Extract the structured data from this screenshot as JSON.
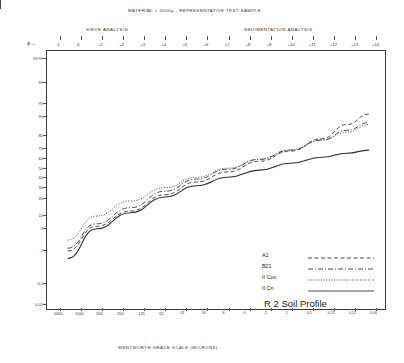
{
  "header": {
    "material_title": "MATERIAL   < 2000µ   -   REPRESENTATIVE  TEST  SAMPLE",
    "sieve_analysis": "SIEVE   ANALYSIS",
    "sedimentation_analysis": "SEDIMENTATION   ANALYSIS",
    "phi_arrow": "φ →"
  },
  "chart_data": {
    "type": "line",
    "title": "R 2 Soil Profile",
    "xlabel": "WENTWORTH GRADE SCALE (MICRONS)",
    "ylabel": "CUMULATIVE WEIGHT PERCENT",
    "xscale": "phi / log-micron",
    "yscale": "probability",
    "grid": false,
    "legend_position": "lower-right",
    "phi_ticks": [
      "-1",
      "0",
      "+1",
      "+2",
      "+3",
      "+4",
      "+5",
      "+6",
      "+7",
      "+8",
      "+9",
      "+10",
      "+11",
      "+12",
      "+13",
      "+14"
    ],
    "x_ticks_microns": [
      "2000",
      "1000",
      "500",
      "250",
      "125",
      "62",
      "31",
      "16",
      "8",
      "4",
      "2",
      "1",
      "0.5",
      "0.25",
      "0.12",
      "0.06"
    ],
    "y_ticks": [
      "0.01",
      "0.1",
      "1",
      "5",
      "10",
      "20",
      "30",
      "40",
      "50",
      "60",
      "70",
      "80",
      "90",
      "95",
      "99",
      "99.99"
    ],
    "series": [
      {
        "name": "A1",
        "style": "dashed",
        "points": [
          {
            "x": 0.04,
            "y": 1.0
          },
          {
            "x": 0.13,
            "y": 6.0
          },
          {
            "x": 0.24,
            "y": 13.0
          },
          {
            "x": 0.35,
            "y": 24.0
          },
          {
            "x": 0.45,
            "y": 36.0
          },
          {
            "x": 0.55,
            "y": 47.0
          },
          {
            "x": 0.65,
            "y": 58.0
          },
          {
            "x": 0.75,
            "y": 68.0
          },
          {
            "x": 0.85,
            "y": 78.0
          },
          {
            "x": 0.93,
            "y": 86.0
          },
          {
            "x": 1.0,
            "y": 91.0
          }
        ]
      },
      {
        "name": "B21",
        "style": "dash-dot",
        "points": [
          {
            "x": 0.04,
            "y": 1.5
          },
          {
            "x": 0.13,
            "y": 7.0
          },
          {
            "x": 0.24,
            "y": 15.0
          },
          {
            "x": 0.35,
            "y": 27.0
          },
          {
            "x": 0.45,
            "y": 39.0
          },
          {
            "x": 0.55,
            "y": 50.0
          },
          {
            "x": 0.65,
            "y": 60.0
          },
          {
            "x": 0.75,
            "y": 69.0
          },
          {
            "x": 0.85,
            "y": 77.0
          },
          {
            "x": 0.93,
            "y": 83.0
          },
          {
            "x": 1.0,
            "y": 87.0
          }
        ]
      },
      {
        "name": "II Cox",
        "style": "solid",
        "points": [
          {
            "x": 0.04,
            "y": 3.0
          },
          {
            "x": 0.13,
            "y": 10.0
          },
          {
            "x": 0.24,
            "y": 19.0
          },
          {
            "x": 0.35,
            "y": 30.0
          },
          {
            "x": 0.45,
            "y": 41.0
          },
          {
            "x": 0.55,
            "y": 51.0
          },
          {
            "x": 0.65,
            "y": 60.0
          },
          {
            "x": 0.75,
            "y": 69.0
          },
          {
            "x": 0.85,
            "y": 77.0
          },
          {
            "x": 0.93,
            "y": 82.0
          },
          {
            "x": 1.0,
            "y": 86.0
          }
        ]
      },
      {
        "name": "II Cn",
        "style": "dotted",
        "points": [
          {
            "x": 0.04,
            "y": 0.8
          },
          {
            "x": 0.13,
            "y": 5.0
          },
          {
            "x": 0.24,
            "y": 12.0
          },
          {
            "x": 0.35,
            "y": 22.0
          },
          {
            "x": 0.45,
            "y": 32.0
          },
          {
            "x": 0.55,
            "y": 41.0
          },
          {
            "x": 0.65,
            "y": 49.0
          },
          {
            "x": 0.75,
            "y": 56.0
          },
          {
            "x": 0.85,
            "y": 62.0
          },
          {
            "x": 0.93,
            "y": 66.0
          },
          {
            "x": 1.0,
            "y": 69.0
          }
        ]
      }
    ],
    "legend": [
      {
        "name": "A1",
        "style": "dashed"
      },
      {
        "name": "B21",
        "style": "dash-dot"
      },
      {
        "name": "II Cox",
        "style": "solid"
      },
      {
        "name": "II Cn",
        "style": "dotted"
      }
    ]
  }
}
